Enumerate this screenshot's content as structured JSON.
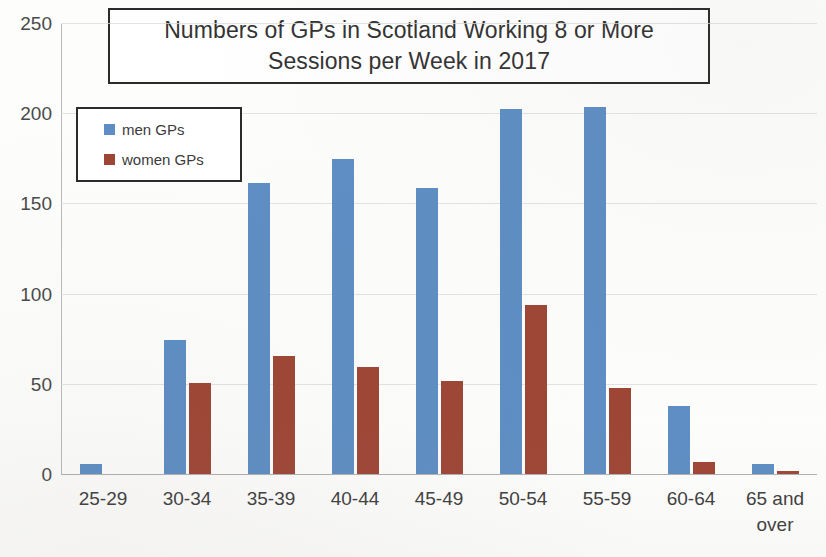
{
  "chart_data": {
    "type": "bar",
    "title": "Numbers of GPs in Scotland Working 8 or More Sessions per Week in 2017",
    "title_lines": [
      "Numbers of GPs in Scotland Working 8 or More",
      "Sessions per Week in 2017"
    ],
    "subtitle": "",
    "xlabel": "",
    "ylabel": "",
    "ylim": [
      0,
      250
    ],
    "yticks": [
      0,
      50,
      100,
      150,
      200,
      250
    ],
    "ytick_labels": [
      "0",
      "50",
      "100",
      "150",
      "200",
      "250"
    ],
    "grid": true,
    "legend_position": "upper-left",
    "categories": [
      "25-29",
      "30-34",
      "35-39",
      "40-44",
      "45-49",
      "50-54",
      "55-59",
      "60-64",
      "65 and over"
    ],
    "category_lines": [
      [
        "25-29"
      ],
      [
        "30-34"
      ],
      [
        "35-39"
      ],
      [
        "40-44"
      ],
      [
        "45-49"
      ],
      [
        "50-54"
      ],
      [
        "55-59"
      ],
      [
        "60-64"
      ],
      [
        "65 and",
        "over"
      ]
    ],
    "series": [
      {
        "name": "men GPs",
        "color": "#5e8ec4",
        "values": [
          6,
          75,
          162,
          175,
          159,
          203,
          204,
          38,
          6
        ]
      },
      {
        "name": "women GPs",
        "color": "#9e4636",
        "values": [
          0,
          51,
          66,
          60,
          52,
          94,
          48,
          7,
          2
        ]
      }
    ]
  },
  "legend": {
    "items": [
      {
        "label": "men GPs",
        "color": "#5e8ec4"
      },
      {
        "label": "women GPs",
        "color": "#9e4636"
      }
    ]
  },
  "colors": {
    "men": "#5e8ec4",
    "women": "#9e4636",
    "grid": "#d9d9d9",
    "axis": "#b0b0b0",
    "text": "#3a3a3a",
    "box_border": "#2b2b2b",
    "background": "#fdfdfc"
  }
}
